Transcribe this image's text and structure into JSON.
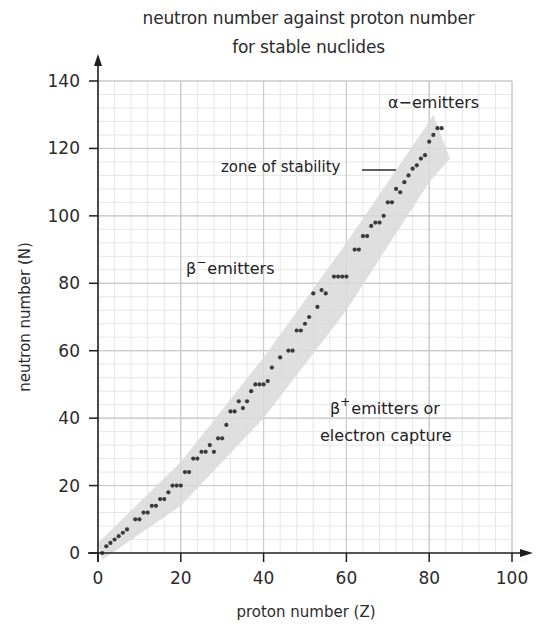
{
  "chart_data": {
    "type": "scatter",
    "title": "neutron number against proton number",
    "subtitle": "for stable nuclides",
    "xlabel": "proton number (Z)",
    "ylabel": "neutron number (N)",
    "xlim": [
      0,
      100
    ],
    "ylim": [
      0,
      140
    ],
    "xticks": [
      0,
      20,
      40,
      60,
      80,
      100
    ],
    "yticks": [
      0,
      20,
      40,
      60,
      80,
      100,
      120,
      140
    ],
    "grid": true,
    "grid_minor_step_x": 4,
    "grid_minor_step_y": 4,
    "legend": null,
    "annotations": [
      {
        "text": "α−emitters",
        "x": 82,
        "y": 133
      },
      {
        "text": "zone of stability",
        "x": 54,
        "y": 117,
        "leader_line": true
      },
      {
        "text": "β⁻emitters",
        "x": 32,
        "y": 83
      },
      {
        "text": "β⁺emitters or",
        "x": 62,
        "y": 43
      },
      {
        "text": "electron capture",
        "x": 62,
        "y": 35
      }
    ],
    "band": {
      "name": "zone of stability",
      "color": "#d9d9d9",
      "lower_edge": [
        [
          1,
          -2
        ],
        [
          20,
          14
        ],
        [
          40,
          40
        ],
        [
          60,
          72
        ],
        [
          80,
          110
        ],
        [
          85,
          117
        ]
      ],
      "upper_edge": [
        [
          0,
          3
        ],
        [
          20,
          27
        ],
        [
          40,
          58
        ],
        [
          60,
          92
        ],
        [
          80,
          128
        ],
        [
          81,
          130
        ]
      ]
    },
    "series": [
      {
        "name": "stable nuclides",
        "marker_color": "#3a3a3a",
        "points": [
          [
            1,
            0
          ],
          [
            2,
            2
          ],
          [
            3,
            3
          ],
          [
            4,
            4
          ],
          [
            5,
            5
          ],
          [
            6,
            6
          ],
          [
            7,
            7
          ],
          [
            9,
            10
          ],
          [
            10,
            10
          ],
          [
            11,
            12
          ],
          [
            12,
            12
          ],
          [
            13,
            14
          ],
          [
            14,
            14
          ],
          [
            15,
            16
          ],
          [
            16,
            16
          ],
          [
            17,
            18
          ],
          [
            18,
            20
          ],
          [
            19,
            20
          ],
          [
            20,
            20
          ],
          [
            21,
            24
          ],
          [
            22,
            24
          ],
          [
            23,
            28
          ],
          [
            24,
            28
          ],
          [
            25,
            30
          ],
          [
            26,
            30
          ],
          [
            27,
            32
          ],
          [
            28,
            30
          ],
          [
            29,
            34
          ],
          [
            30,
            34
          ],
          [
            31,
            38
          ],
          [
            32,
            42
          ],
          [
            33,
            42
          ],
          [
            34,
            45
          ],
          [
            35,
            43
          ],
          [
            36,
            45
          ],
          [
            37,
            48
          ],
          [
            38,
            50
          ],
          [
            39,
            50
          ],
          [
            40,
            50
          ],
          [
            41,
            51
          ],
          [
            42,
            55
          ],
          [
            44,
            58
          ],
          [
            46,
            60
          ],
          [
            47,
            60
          ],
          [
            48,
            66
          ],
          [
            49,
            66
          ],
          [
            50,
            68
          ],
          [
            51,
            70
          ],
          [
            52,
            77
          ],
          [
            53,
            73
          ],
          [
            54,
            78
          ],
          [
            55,
            77
          ],
          [
            57,
            82
          ],
          [
            58,
            82
          ],
          [
            59,
            82
          ],
          [
            60,
            82
          ],
          [
            62,
            90
          ],
          [
            63,
            90
          ],
          [
            64,
            94
          ],
          [
            65,
            94
          ],
          [
            66,
            97
          ],
          [
            67,
            98
          ],
          [
            68,
            98
          ],
          [
            69,
            100
          ],
          [
            70,
            104
          ],
          [
            71,
            104
          ],
          [
            72,
            108
          ],
          [
            73,
            107
          ],
          [
            74,
            110
          ],
          [
            75,
            112
          ],
          [
            76,
            114
          ],
          [
            77,
            115
          ],
          [
            78,
            117
          ],
          [
            79,
            118
          ],
          [
            80,
            122
          ],
          [
            81,
            124
          ],
          [
            82,
            126
          ],
          [
            83,
            126
          ]
        ]
      }
    ]
  },
  "labels": {
    "title_line1": "neutron number against proton number",
    "title_line2": "for stable nuclides",
    "x_axis": "proton number (Z)",
    "y_axis": "neutron number (N)",
    "alpha": "α−emitters",
    "zone": "zone of stability",
    "beta_minus_sym": "β",
    "beta_minus_sup": "−",
    "beta_minus_rest": "emitters",
    "beta_plus_sym": "β",
    "beta_plus_sup": "+",
    "beta_plus_rest": "emitters or",
    "beta_plus_line2": "electron capture"
  },
  "colors": {
    "axis": "#1e1e1e",
    "grid_minor": "#e6e6e6",
    "grid_major": "#c9c9c9",
    "band": "#d9d9d9",
    "dot": "#3a3a3a"
  }
}
